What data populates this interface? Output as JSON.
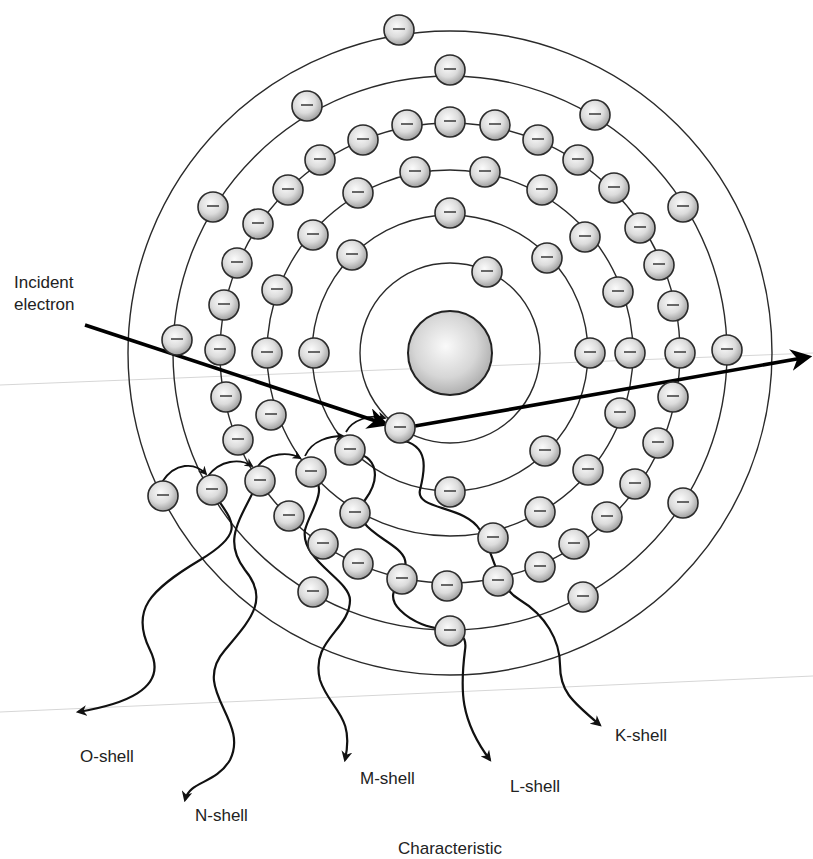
{
  "figure": {
    "title": "Characteristic",
    "incident_label": [
      "Incident",
      "electron"
    ],
    "center": [
      450,
      353
    ],
    "nucleus_radius": 42,
    "electron_radius": 15,
    "colors": {
      "line": "#2a2a2a",
      "electron_fill_light": "#fbfbfb",
      "electron_fill_dark": "#9a9a9a",
      "nucleus_fill_dark": "#a8a8a8"
    }
  },
  "shells": [
    {
      "name": "K-shell",
      "radius": 90
    },
    {
      "name": "L-shell",
      "radius": 138
    },
    {
      "name": "M-shell",
      "radius": 183
    },
    {
      "name": "N-shell",
      "radius": 230
    },
    {
      "name": "O-shell",
      "radius": 277
    },
    {
      "name": "P-shell",
      "radius": 322
    }
  ],
  "electrons": [
    {
      "x": 487,
      "y": 272
    },
    {
      "x": 400,
      "y": 428
    },
    {
      "x": 450,
      "y": 213
    },
    {
      "x": 547,
      "y": 258
    },
    {
      "x": 352,
      "y": 255
    },
    {
      "x": 590,
      "y": 353
    },
    {
      "x": 314,
      "y": 353
    },
    {
      "x": 545,
      "y": 451
    },
    {
      "x": 450,
      "y": 492
    },
    {
      "x": 355,
      "y": 513
    },
    {
      "x": 415,
      "y": 172
    },
    {
      "x": 485,
      "y": 172
    },
    {
      "x": 542,
      "y": 190
    },
    {
      "x": 585,
      "y": 237
    },
    {
      "x": 618,
      "y": 292
    },
    {
      "x": 630,
      "y": 353
    },
    {
      "x": 620,
      "y": 413
    },
    {
      "x": 588,
      "y": 470
    },
    {
      "x": 540,
      "y": 512
    },
    {
      "x": 493,
      "y": 538
    },
    {
      "x": 447,
      "y": 586
    },
    {
      "x": 358,
      "y": 193
    },
    {
      "x": 313,
      "y": 235
    },
    {
      "x": 277,
      "y": 290
    },
    {
      "x": 267,
      "y": 353
    },
    {
      "x": 271,
      "y": 415
    },
    {
      "x": 311,
      "y": 472
    },
    {
      "x": 350,
      "y": 450
    },
    {
      "x": 402,
      "y": 579
    },
    {
      "x": 358,
      "y": 564
    },
    {
      "x": 407,
      "y": 125
    },
    {
      "x": 450,
      "y": 122
    },
    {
      "x": 495,
      "y": 125
    },
    {
      "x": 538,
      "y": 140
    },
    {
      "x": 578,
      "y": 160
    },
    {
      "x": 614,
      "y": 188
    },
    {
      "x": 640,
      "y": 228
    },
    {
      "x": 659,
      "y": 265
    },
    {
      "x": 673,
      "y": 306
    },
    {
      "x": 680,
      "y": 353
    },
    {
      "x": 673,
      "y": 397
    },
    {
      "x": 658,
      "y": 443
    },
    {
      "x": 635,
      "y": 484
    },
    {
      "x": 607,
      "y": 517
    },
    {
      "x": 574,
      "y": 544
    },
    {
      "x": 540,
      "y": 567
    },
    {
      "x": 498,
      "y": 581
    },
    {
      "x": 363,
      "y": 140
    },
    {
      "x": 320,
      "y": 160
    },
    {
      "x": 288,
      "y": 190
    },
    {
      "x": 258,
      "y": 224
    },
    {
      "x": 237,
      "y": 263
    },
    {
      "x": 224,
      "y": 305
    },
    {
      "x": 220,
      "y": 350
    },
    {
      "x": 226,
      "y": 397
    },
    {
      "x": 238,
      "y": 440
    },
    {
      "x": 260,
      "y": 481
    },
    {
      "x": 289,
      "y": 516
    },
    {
      "x": 323,
      "y": 544
    },
    {
      "x": 450,
      "y": 70
    },
    {
      "x": 595,
      "y": 115
    },
    {
      "x": 683,
      "y": 207
    },
    {
      "x": 727,
      "y": 350
    },
    {
      "x": 683,
      "y": 503
    },
    {
      "x": 583,
      "y": 597
    },
    {
      "x": 450,
      "y": 631
    },
    {
      "x": 313,
      "y": 592
    },
    {
      "x": 212,
      "y": 490
    },
    {
      "x": 177,
      "y": 340
    },
    {
      "x": 213,
      "y": 207
    },
    {
      "x": 307,
      "y": 106
    },
    {
      "x": 399,
      "y": 30
    },
    {
      "x": 163,
      "y": 496
    }
  ],
  "incident_beam": {
    "from": [
      85,
      325
    ],
    "to": [
      385,
      424
    ]
  },
  "scattered_beam": {
    "from": [
      415,
      426
    ],
    "to": [
      808,
      357
    ]
  },
  "cascade_labels": [
    {
      "text": "O-shell",
      "x": 80,
      "y": 746
    },
    {
      "text": "N-shell",
      "x": 195,
      "y": 805
    },
    {
      "text": "M-shell",
      "x": 360,
      "y": 768
    },
    {
      "text": "L-shell",
      "x": 510,
      "y": 776
    },
    {
      "text": "K-shell",
      "x": 615,
      "y": 725
    }
  ],
  "caption": "Characteristic"
}
